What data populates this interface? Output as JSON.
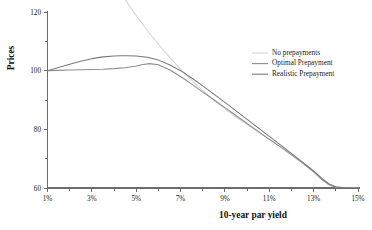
{
  "chart_data": {
    "type": "line",
    "title": "",
    "xlabel": "10-year par yield",
    "ylabel": "Prices",
    "xlim": [
      1,
      15
    ],
    "ylim": [
      60,
      120
    ],
    "grid": false,
    "legend_position": "right-upper",
    "x_ticks_major": [
      "1%",
      "3%",
      "5%",
      "7%",
      "9%",
      "11%",
      "13%",
      "15%"
    ],
    "x_tick_values_major": [
      1,
      3,
      5,
      7,
      9,
      11,
      13,
      15
    ],
    "x_tick_values_minor": [
      2,
      4,
      6,
      8,
      10,
      12,
      14
    ],
    "y_ticks_major": [
      "120",
      "100",
      "80",
      "60"
    ],
    "y_tick_values_major": [
      120,
      100,
      80,
      60
    ],
    "y_tick_values_minor": [
      110,
      90,
      70
    ],
    "series": [
      {
        "name": "No prepayments",
        "color": "#d2d2d2",
        "x": [
          1.0,
          1.5,
          2.0,
          2.5,
          3.0,
          3.5,
          4.0,
          4.3,
          4.6,
          5.0,
          5.5,
          6.0,
          6.5,
          7.0,
          7.5,
          8.0,
          8.5,
          9.0,
          9.5,
          10.0,
          10.5,
          11.0,
          11.5,
          12.0,
          12.5,
          13.0,
          13.4,
          13.7,
          14.0,
          14.5,
          15.0
        ],
        "y": [
          171.0,
          163.5,
          156.2,
          149.2,
          142.5,
          136.1,
          130.0,
          126.5,
          123.1,
          118.8,
          113.7,
          109.0,
          104.6,
          100.5,
          96.7,
          93.2,
          90.0,
          87.0,
          84.2,
          81.6,
          79.1,
          76.6,
          74.1,
          71.5,
          68.7,
          65.6,
          62.8,
          61.2,
          60.3,
          60.0,
          60.0
        ]
      },
      {
        "name": "Optimal Prepayment",
        "color": "#8c8c8c",
        "x": [
          1.0,
          1.5,
          2.0,
          2.5,
          3.0,
          3.5,
          4.0,
          4.5,
          5.0,
          5.3,
          5.6,
          6.0,
          6.5,
          7.0,
          7.5,
          8.0,
          8.5,
          9.0,
          9.5,
          10.0,
          10.5,
          11.0,
          11.5,
          12.0,
          12.5,
          13.0,
          13.4,
          13.7,
          14.0,
          14.5,
          15.0
        ],
        "y": [
          100.0,
          100.1,
          100.2,
          100.3,
          100.4,
          100.5,
          100.7,
          101.0,
          101.6,
          102.1,
          102.4,
          102.0,
          100.3,
          98.0,
          95.4,
          92.7,
          90.1,
          87.4,
          84.7,
          82.0,
          79.3,
          76.6,
          74.0,
          71.3,
          68.5,
          65.5,
          62.7,
          61.1,
          60.25,
          60.0,
          60.0
        ]
      },
      {
        "name": "Realistic Prepayment",
        "color": "#7a7a7a",
        "x": [
          1.0,
          1.5,
          2.0,
          2.5,
          3.0,
          3.5,
          4.0,
          4.3,
          4.6,
          5.0,
          5.5,
          6.0,
          6.5,
          7.0,
          7.5,
          8.0,
          8.5,
          9.0,
          9.5,
          10.0,
          10.5,
          11.0,
          11.5,
          12.0,
          12.5,
          13.0,
          13.4,
          13.7,
          14.0,
          14.5,
          15.0
        ],
        "y": [
          100.0,
          101.1,
          102.2,
          103.2,
          104.1,
          104.7,
          105.0,
          105.1,
          105.1,
          105.0,
          104.6,
          103.6,
          102.0,
          100.0,
          97.5,
          94.8,
          92.0,
          89.2,
          86.3,
          83.4,
          80.5,
          77.6,
          74.7,
          71.8,
          68.8,
          65.8,
          63.1,
          61.4,
          60.4,
          60.0,
          60.0
        ]
      }
    ]
  },
  "legend": {
    "items": [
      {
        "label": "No prepayments",
        "color": "#d2d2d2"
      },
      {
        "label": "Optimal Prepayment",
        "color": "#8c8c8c"
      },
      {
        "label": "Realistic Prepayment",
        "color": "#7a7a7a"
      }
    ]
  }
}
